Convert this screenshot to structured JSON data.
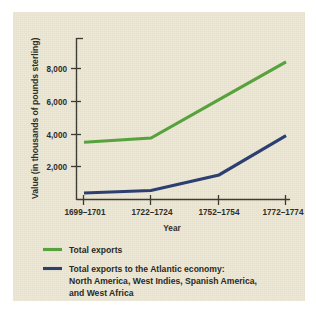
{
  "figure": {
    "background_color": "#ffffff",
    "panel_color": "#ece6d2"
  },
  "chart_data": {
    "type": "line",
    "title": "",
    "xlabel": "Year",
    "ylabel": "Value (in thousands of pounds sterling)",
    "categories": [
      "1699–1701",
      "1722–1724",
      "1752–1754",
      "1772–1774"
    ],
    "ylim": [
      0,
      9000
    ],
    "yticks": [
      2000,
      4000,
      6000,
      8000
    ],
    "ytick_labels": [
      "2,000",
      "4,000",
      "6,000",
      "8,000"
    ],
    "grid": false,
    "legend_position": "below",
    "series": [
      {
        "name": "Total exports",
        "color": "#57a23c",
        "values": [
          3500,
          3750,
          6100,
          8400
        ]
      },
      {
        "name": "Total exports to the Atlantic economy: North America, West Indies, Spanish America, and West Africa",
        "color": "#2b3f70",
        "values": [
          400,
          550,
          1500,
          3900
        ]
      }
    ]
  },
  "axes": {
    "y_title": "Value (in thousands of pounds sterling)",
    "x_title": "Year",
    "y_tick_labels": [
      "8,000",
      "6,000",
      "4,000",
      "2,000"
    ],
    "x_tick_labels": [
      "1699–1701",
      "1722–1724",
      "1752–1754",
      "1772–1774"
    ]
  },
  "legend": {
    "entries": [
      {
        "swatch_color": "#57a23c",
        "line1": "Total exports",
        "line2": "",
        "line3": ""
      },
      {
        "swatch_color": "#2b3f70",
        "line1": "Total exports to the Atlantic economy:",
        "line2": "North America, West Indies, Spanish America,",
        "line3": "and West Africa"
      }
    ]
  }
}
